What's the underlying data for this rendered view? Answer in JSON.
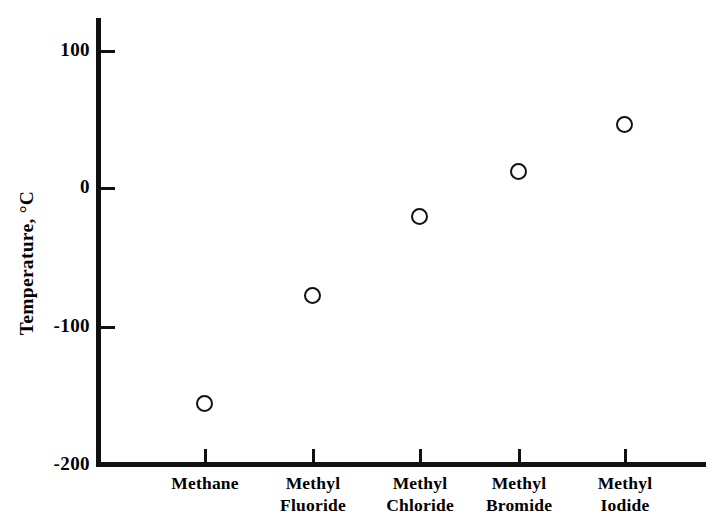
{
  "chart_data": {
    "type": "scatter",
    "title": "",
    "subtitle": "",
    "xlabel": "",
    "ylabel": "Temperature, °C",
    "categories": [
      "Methane",
      "Methyl Fluoride",
      "Methyl Chloride",
      "Methyl Bromide",
      "Methyl Iodide"
    ],
    "category_label_lines": [
      [
        "Methane"
      ],
      [
        "Methyl",
        "Fluoride"
      ],
      [
        "Methyl",
        "Chloride"
      ],
      [
        "Methyl",
        "Bromide"
      ],
      [
        "Methyl",
        "Iodide"
      ]
    ],
    "values": [
      -156,
      -78,
      -21,
      12,
      46
    ],
    "points": [
      {
        "category": "Methane",
        "value": -156
      },
      {
        "category": "Methyl Fluoride",
        "value": -78
      },
      {
        "category": "Methyl Chloride",
        "value": -21
      },
      {
        "category": "Methyl Bromide",
        "value": 12
      },
      {
        "category": "Methyl Iodide",
        "value": 46
      }
    ],
    "ylim": [
      -200,
      125
    ],
    "yticks": [
      100,
      0,
      -100,
      -200
    ],
    "ytick_labels": [
      "100",
      "0",
      "-100",
      "-200"
    ],
    "grid": false,
    "legend": false,
    "legend_position": "none",
    "marker_style": "open-circle",
    "marker_color": "#111111",
    "background_color": "#ffffff",
    "axis_color": "#111111"
  },
  "axis": {
    "y_title": "Temperature, °C",
    "tick_labels": {
      "t100": "100",
      "t0": "0",
      "tm100": "-100",
      "tm200": "-200"
    }
  },
  "categories": {
    "c0": "Methane",
    "c1": "Methyl\nFluoride",
    "c2": "Methyl\nChloride",
    "c3": "Methyl\nBromide",
    "c4": "Methyl\nIodide"
  }
}
